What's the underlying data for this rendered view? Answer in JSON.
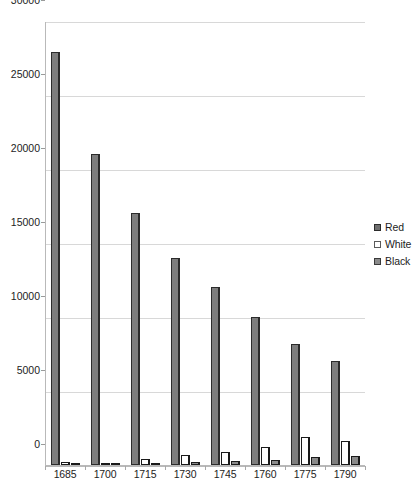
{
  "chart_data": {
    "type": "bar",
    "title": "",
    "subtitle": "",
    "xlabel": "",
    "ylabel": "",
    "categories": [
      "1685",
      "1700",
      "1715",
      "1730",
      "1745",
      "1760",
      "1775",
      "1790"
    ],
    "series": [
      {
        "name": "Red",
        "color": "#7d7d7d",
        "values": [
          27900,
          21000,
          17000,
          14000,
          12000,
          10000,
          8200,
          7000
        ]
      },
      {
        "name": "White",
        "color": "#ffffff",
        "values": [
          200,
          150,
          400,
          700,
          900,
          1200,
          1900,
          1650
        ]
      },
      {
        "name": "Black",
        "color": "#8a8a8a",
        "values": [
          60,
          80,
          120,
          220,
          260,
          330,
          520,
          620
        ]
      }
    ],
    "ylim": [
      0,
      30000
    ],
    "yticks": [
      0,
      5000,
      10000,
      15000,
      20000,
      25000,
      30000
    ],
    "ytick_labels": [
      "0",
      "5000",
      "10000",
      "15000",
      "20000",
      "25000",
      "30000"
    ],
    "grid": true,
    "legend_position": "right",
    "legend": [
      "Red",
      "White",
      "Black"
    ]
  },
  "legend": {
    "items": [
      {
        "label": "Red",
        "swatch": "legend-swatch-red"
      },
      {
        "label": "White",
        "swatch": "legend-swatch-white"
      },
      {
        "label": "Black",
        "swatch": "legend-swatch-black"
      }
    ]
  }
}
